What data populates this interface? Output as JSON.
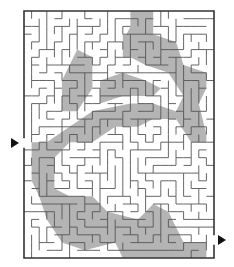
{
  "puzzle": {
    "type": "maze",
    "grid": {
      "cols": 25,
      "rows": 32
    },
    "bounds": {
      "x": 24,
      "y": 11,
      "w": 190,
      "h": 247
    },
    "colors": {
      "wall": "#555555",
      "border": "#333333",
      "shade": "#b4b4b4",
      "background": "#ffffff",
      "arrow": "#111111"
    },
    "entry": {
      "side": "left",
      "y": 143,
      "label": "start-arrow"
    },
    "exit": {
      "side": "right",
      "y": 240,
      "label": "end-arrow"
    },
    "shaded_regions": [
      [
        [
          14,
          0
        ],
        [
          17,
          0
        ],
        [
          17,
          3
        ],
        [
          20,
          4
        ],
        [
          21,
          7
        ],
        [
          24,
          8
        ],
        [
          24,
          10
        ],
        [
          23,
          12
        ],
        [
          24,
          16
        ],
        [
          24,
          17
        ],
        [
          22,
          17
        ],
        [
          20,
          14
        ],
        [
          17,
          14
        ],
        [
          15,
          15
        ],
        [
          12,
          15
        ],
        [
          9,
          17
        ],
        [
          6,
          17
        ],
        [
          4,
          19
        ],
        [
          4,
          23
        ],
        [
          6,
          24
        ],
        [
          9,
          24
        ],
        [
          11,
          26
        ],
        [
          15,
          27
        ],
        [
          17,
          25
        ],
        [
          19,
          26
        ],
        [
          21,
          30
        ],
        [
          24,
          30
        ],
        [
          24,
          32
        ],
        [
          13,
          32
        ],
        [
          12,
          30
        ],
        [
          8,
          31
        ],
        [
          5,
          30
        ],
        [
          3,
          27
        ],
        [
          2,
          24
        ],
        [
          1,
          22
        ],
        [
          1,
          19
        ],
        [
          3,
          17
        ],
        [
          6,
          15
        ],
        [
          9,
          13
        ],
        [
          14,
          12
        ],
        [
          17,
          12
        ],
        [
          20,
          13
        ],
        [
          21,
          11
        ],
        [
          19,
          8
        ],
        [
          16,
          7
        ],
        [
          14,
          6
        ],
        [
          13,
          4
        ],
        [
          14,
          2
        ]
      ],
      [
        [
          10,
          9
        ],
        [
          13,
          8
        ],
        [
          16,
          9
        ],
        [
          18,
          10
        ],
        [
          17,
          11
        ],
        [
          13,
          11
        ],
        [
          10,
          12
        ]
      ],
      [
        [
          7,
          5
        ],
        [
          9,
          6
        ],
        [
          9,
          10
        ],
        [
          7,
          13
        ],
        [
          5,
          13
        ],
        [
          5,
          9
        ]
      ],
      [
        [
          1,
          17
        ],
        [
          4,
          17
        ],
        [
          4,
          19
        ],
        [
          2,
          20
        ],
        [
          1,
          19
        ]
      ],
      [
        [
          13,
          3
        ],
        [
          17,
          4
        ],
        [
          17,
          6
        ],
        [
          13,
          6
        ]
      ]
    ]
  }
}
